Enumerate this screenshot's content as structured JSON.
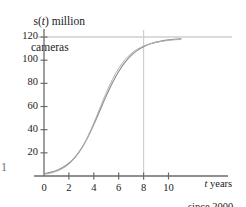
{
  "figure": {
    "axis_color": "#6b6b6b",
    "curve_color": "#8c8c8c",
    "curve_color_secondary": "#b0b0b0",
    "asymptote_color": "#b8b8b8",
    "vline_color": "#cfcfcf",
    "stray_mark": "1"
  },
  "axis_labels": {
    "y_line1_pre": "s(",
    "y_line1_var": "t",
    "y_line1_post": ") million",
    "y_line2": "cameras",
    "x_line1_var": "t",
    "x_line1_post": " years",
    "x_line2": "since 2000"
  },
  "chart_data": {
    "type": "line",
    "title": "",
    "xlabel": "t years since 2000",
    "ylabel": "s(t) million cameras",
    "xlim": [
      -0.6,
      11.4
    ],
    "ylim": [
      0,
      132
    ],
    "xticks": [
      0,
      2,
      4,
      6,
      8,
      10
    ],
    "xticklabels": [
      "0",
      "2",
      "4",
      "6",
      "8",
      "10"
    ],
    "yticks": [
      20,
      40,
      60,
      80,
      100,
      120
    ],
    "yticklabels": [
      "20",
      "40",
      "60",
      "80",
      "100",
      "120"
    ],
    "grid": false,
    "legend": false,
    "annotations": [
      {
        "kind": "horizontal-asymptote",
        "y": 120,
        "label": "carrying capacity 120"
      },
      {
        "kind": "vertical-line",
        "x": 8,
        "label": "t = 8"
      }
    ],
    "series": [
      {
        "name": "logistic model s(t)",
        "x": [
          0,
          0.5,
          1,
          1.5,
          2,
          2.5,
          3,
          3.5,
          4,
          4.5,
          5,
          5.5,
          6,
          6.5,
          7,
          7.5,
          8,
          8.5,
          9,
          9.5,
          10,
          10.5,
          11
        ],
        "y": [
          2.0,
          3.1,
          4.8,
          7.3,
          11.0,
          16.3,
          23.6,
          33.1,
          44.4,
          56.8,
          69.2,
          80.6,
          90.3,
          98.1,
          104.1,
          108.5,
          111.7,
          114.0,
          115.6,
          116.7,
          117.5,
          118.1,
          118.5
        ]
      },
      {
        "name": "comparison curve",
        "x": [
          0,
          0.5,
          1,
          1.5,
          2,
          2.5,
          3,
          3.5,
          4,
          4.5,
          5,
          5.5,
          6,
          6.5,
          7,
          7.5,
          8,
          8.5,
          9,
          9.5,
          10,
          10.5,
          11
        ],
        "y": [
          1.4,
          2.4,
          4.0,
          6.5,
          10.3,
          15.8,
          23.5,
          33.6,
          45.7,
          58.9,
          71.9,
          83.5,
          93.0,
          100.3,
          105.7,
          109.5,
          112.2,
          114.1,
          115.4,
          116.4,
          117.1,
          117.6,
          118.0
        ]
      }
    ]
  }
}
